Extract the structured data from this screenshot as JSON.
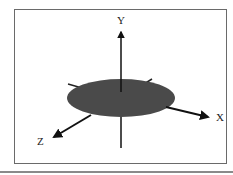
{
  "diagram": {
    "type": "3d-coordinate-axes",
    "axes": [
      {
        "name": "y-axis",
        "label": "Y"
      },
      {
        "name": "x-axis",
        "label": "X"
      },
      {
        "name": "z-axis",
        "label": "Z"
      }
    ],
    "plane": {
      "shape": "ellipse",
      "color": "#4a4a4a"
    },
    "axis_color": "#111111",
    "frame_color": "#6a6a6a"
  }
}
